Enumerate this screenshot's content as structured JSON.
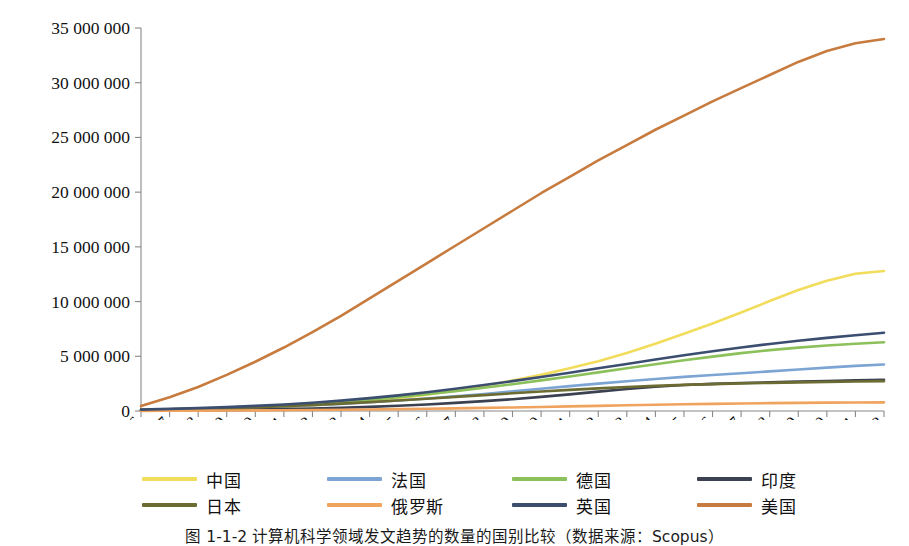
{
  "chart_data": {
    "type": "line",
    "title": "",
    "xlabel": "",
    "ylabel": "",
    "grid": false,
    "legend_position": "bottom",
    "xlim": [
      1996,
      2022
    ],
    "ylim": [
      0,
      35000000
    ],
    "ytick_step": 5000000,
    "ytick_labels": [
      "35 000 000",
      "30 000 000",
      "25 000 000",
      "20 000 000",
      "15 000 000",
      "10 000 000",
      "5 000 000",
      "0"
    ],
    "ytick_values": [
      35000000,
      30000000,
      25000000,
      20000000,
      15000000,
      10000000,
      5000000,
      0
    ],
    "categories": [
      "1996",
      "1997",
      "1998",
      "1999",
      "2000",
      "2001",
      "2002",
      "2003",
      "2004",
      "2005",
      "2006",
      "2007",
      "2008",
      "2009",
      "2010",
      "2011",
      "2012",
      "2013",
      "2014",
      "2015",
      "2016",
      "2017",
      "2018",
      "2019",
      "2020",
      "2021",
      "2022"
    ],
    "series": [
      {
        "name": "中国",
        "color": "#F2DC5C",
        "values": [
          60000,
          90000,
          130000,
          190000,
          270000,
          370000,
          500000,
          680000,
          900000,
          1180000,
          1500000,
          1880000,
          2300000,
          2780000,
          3300000,
          3900000,
          4550000,
          5300000,
          6150000,
          7050000,
          8000000,
          9000000,
          10050000,
          11050000,
          11900000,
          12550000,
          12800000
        ]
      },
      {
        "name": "法国",
        "color": "#7DA5D4",
        "values": [
          90000,
          130000,
          180000,
          240000,
          320000,
          410000,
          520000,
          650000,
          800000,
          960000,
          1140000,
          1340000,
          1560000,
          1790000,
          2030000,
          2270000,
          2500000,
          2720000,
          2930000,
          3120000,
          3290000,
          3450000,
          3620000,
          3790000,
          3960000,
          4120000,
          4250000
        ]
      },
      {
        "name": "德国",
        "color": "#8CC05A",
        "values": [
          110000,
          160000,
          220000,
          300000,
          400000,
          520000,
          670000,
          840000,
          1040000,
          1270000,
          1530000,
          1810000,
          2120000,
          2450000,
          2800000,
          3160000,
          3530000,
          3900000,
          4270000,
          4630000,
          4970000,
          5290000,
          5560000,
          5790000,
          5990000,
          6150000,
          6280000
        ]
      },
      {
        "name": "印度",
        "color": "#3B4150",
        "values": [
          30000,
          45000,
          65000,
          90000,
          125000,
          170000,
          225000,
          295000,
          380000,
          480000,
          600000,
          740000,
          900000,
          1080000,
          1290000,
          1520000,
          1770000,
          2010000,
          2220000,
          2380000,
          2480000,
          2560000,
          2620000,
          2680000,
          2740000,
          2800000,
          2860000
        ]
      },
      {
        "name": "日本",
        "color": "#6B6B32",
        "values": [
          100000,
          145000,
          200000,
          265000,
          345000,
          440000,
          550000,
          675000,
          815000,
          965000,
          1125000,
          1290000,
          1455000,
          1620000,
          1780000,
          1930000,
          2070000,
          2190000,
          2300000,
          2390000,
          2460000,
          2520000,
          2570000,
          2620000,
          2660000,
          2700000,
          2730000
        ]
      },
      {
        "name": "俄罗斯",
        "color": "#F0A35E",
        "values": [
          15000,
          22000,
          31000,
          42000,
          56000,
          72000,
          92000,
          115000,
          142000,
          172000,
          206000,
          243000,
          283000,
          326000,
          372000,
          420000,
          470000,
          520000,
          570000,
          615000,
          655000,
          690000,
          720000,
          745000,
          765000,
          780000,
          790000
        ]
      },
      {
        "name": "英国",
        "color": "#3B4E70",
        "values": [
          130000,
          190000,
          265000,
          355000,
          465000,
          600000,
          760000,
          950000,
          1175000,
          1430000,
          1715000,
          2030000,
          2370000,
          2730000,
          3110000,
          3500000,
          3900000,
          4300000,
          4700000,
          5090000,
          5460000,
          5810000,
          6130000,
          6420000,
          6680000,
          6920000,
          7150000
        ]
      },
      {
        "name": "美国",
        "color": "#C77B3E",
        "values": [
          450000,
          1250000,
          2200000,
          3300000,
          4500000,
          5800000,
          7200000,
          8700000,
          10300000,
          11900000,
          13500000,
          15100000,
          16700000,
          18300000,
          19900000,
          21400000,
          22900000,
          24300000,
          25700000,
          27000000,
          28300000,
          29500000,
          30700000,
          31900000,
          32900000,
          33600000,
          34000000
        ]
      }
    ]
  },
  "legend": {
    "items": [
      {
        "label": "中国",
        "color": "#F2DC5C"
      },
      {
        "label": "法国",
        "color": "#7DA5D4"
      },
      {
        "label": "德国",
        "color": "#8CC05A"
      },
      {
        "label": "印度",
        "color": "#3B4150"
      },
      {
        "label": "日本",
        "color": "#6B6B32"
      },
      {
        "label": "俄罗斯",
        "color": "#F0A35E"
      },
      {
        "label": "英国",
        "color": "#3B4E70"
      },
      {
        "label": "美国",
        "color": "#C77B3E"
      }
    ]
  },
  "caption": {
    "text": "图 1-1-2  计算机科学领域发文趋势的数量的国别比较（数据来源：Scopus）"
  }
}
